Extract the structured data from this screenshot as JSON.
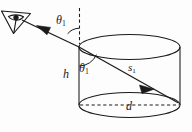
{
  "figure": {
    "background_color": "#fdfdfd",
    "ink_color": "#1a1a1a",
    "labels": {
      "theta_incident": "θ",
      "theta_incident_sub": "1",
      "theta_internal": "θ",
      "theta_internal_sub": "1",
      "height": "h",
      "path": "s",
      "path_sub": "1",
      "diameter": "d"
    },
    "elements": {
      "eye_icon": "eye-icon",
      "normal_line": "dashed vertical normal",
      "diameter_line": "dashed diameter",
      "cylinder": "cylinder",
      "ray": "light ray with arrowheads"
    }
  }
}
